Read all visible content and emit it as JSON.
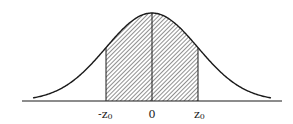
{
  "diagram": {
    "type": "normal-distribution-shaded-area",
    "labels": {
      "left": "-z",
      "left_sub": "0",
      "center": "0",
      "right": "z",
      "right_sub": "0"
    },
    "shaded_region": {
      "from": "-z0",
      "to": "z0"
    },
    "colors": {
      "stroke": "#1a1a1a",
      "background": "#ffffff",
      "hatch": "#333333"
    }
  }
}
